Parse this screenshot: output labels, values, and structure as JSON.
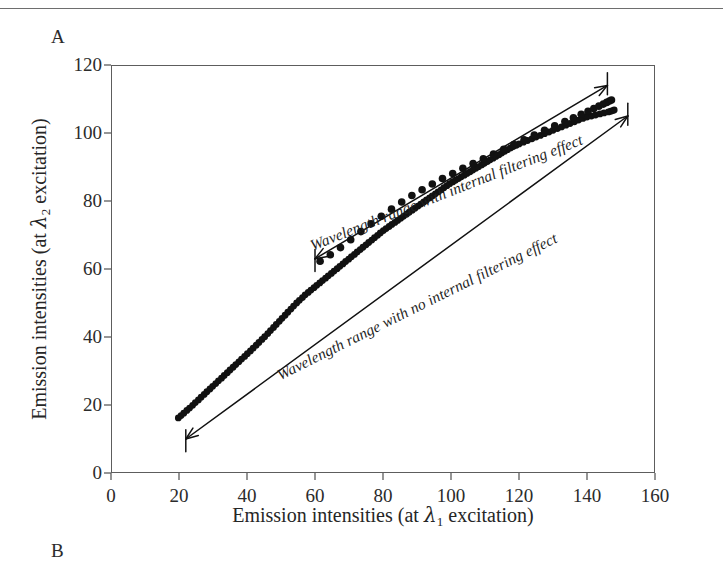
{
  "page": {
    "panel_a_label": "A",
    "panel_b_label": "B"
  },
  "figure": {
    "x_axis_title_prefix": "Emission intensities (at ",
    "x_axis_lambda": "λ",
    "x_axis_sub": "1",
    "x_axis_title_suffix": " excitation)",
    "y_axis_title_prefix": "Emission intensities (at ",
    "y_axis_lambda": "λ",
    "y_axis_sub": "2",
    "y_axis_title_suffix": " excitation)",
    "annotation_upper": "Wavelength range with internal filtering effect",
    "annotation_lower": "Wavelength range with no internal filtering effect"
  },
  "chart_data": {
    "type": "scatter",
    "title": "",
    "xlabel": "Emission intensities (at λ1 excitation)",
    "ylabel": "Emission intensities (at λ2 excitation)",
    "xlim": [
      0,
      160
    ],
    "ylim": [
      0,
      120
    ],
    "xticks": [
      0,
      20,
      40,
      60,
      80,
      100,
      120,
      140,
      160
    ],
    "yticks": [
      0,
      20,
      40,
      60,
      80,
      100,
      120
    ],
    "grid": false,
    "legend": "none",
    "frame": "full-box",
    "annotations": [
      {
        "name": "upper-range-annotation",
        "text": "Wavelength range with internal filtering effect",
        "style": "italic",
        "arrow": "double-headed-with-bars",
        "arrow_from_xy": [
          60,
          63
        ],
        "arrow_to_xy": [
          146,
          114
        ]
      },
      {
        "name": "lower-range-annotation",
        "text": "Wavelength range with no internal filtering effect",
        "style": "italic",
        "arrow": "double-headed-with-bars",
        "arrow_from_xy": [
          22,
          10
        ],
        "arrow_to_xy": [
          152,
          105
        ]
      }
    ],
    "series": [
      {
        "name": "no internal filtering effect",
        "marker": "dense-dots",
        "marker_size": 3.4,
        "points": [
          [
            19.8,
            16.2
          ],
          [
            20.6,
            16.9
          ],
          [
            21.4,
            17.6
          ],
          [
            22.3,
            18.4
          ],
          [
            23.1,
            19.1
          ],
          [
            24.0,
            19.9
          ],
          [
            24.8,
            20.7
          ],
          [
            25.7,
            21.5
          ],
          [
            26.5,
            22.3
          ],
          [
            27.4,
            23.1
          ],
          [
            28.2,
            23.9
          ],
          [
            29.1,
            24.7
          ],
          [
            29.9,
            25.5
          ],
          [
            30.8,
            26.3
          ],
          [
            31.6,
            27.1
          ],
          [
            32.5,
            27.9
          ],
          [
            33.3,
            28.7
          ],
          [
            34.2,
            29.5
          ],
          [
            35.0,
            30.3
          ],
          [
            35.9,
            31.1
          ],
          [
            36.7,
            31.9
          ],
          [
            37.6,
            32.7
          ],
          [
            38.4,
            33.5
          ],
          [
            39.3,
            34.3
          ],
          [
            40.1,
            35.1
          ],
          [
            41.0,
            35.9
          ],
          [
            41.8,
            36.7
          ],
          [
            42.7,
            37.6
          ],
          [
            43.5,
            38.4
          ],
          [
            44.4,
            39.3
          ],
          [
            45.2,
            40.1
          ],
          [
            46.1,
            41.0
          ],
          [
            46.9,
            41.9
          ],
          [
            47.8,
            42.8
          ],
          [
            48.6,
            43.7
          ],
          [
            49.5,
            44.6
          ],
          [
            50.3,
            45.5
          ],
          [
            51.2,
            46.4
          ],
          [
            52.0,
            47.3
          ],
          [
            52.9,
            48.2
          ],
          [
            53.7,
            49.1
          ],
          [
            54.6,
            50.0
          ],
          [
            55.4,
            50.8
          ],
          [
            56.3,
            51.6
          ],
          [
            57.1,
            52.4
          ],
          [
            58.0,
            53.1
          ],
          [
            58.8,
            53.8
          ],
          [
            59.7,
            54.5
          ],
          [
            60.5,
            55.2
          ],
          [
            61.4,
            55.9
          ],
          [
            62.2,
            56.6
          ],
          [
            63.1,
            57.3
          ],
          [
            63.9,
            58.0
          ],
          [
            64.8,
            58.7
          ],
          [
            65.6,
            59.4
          ],
          [
            66.5,
            60.1
          ],
          [
            67.3,
            60.8
          ],
          [
            68.2,
            61.5
          ],
          [
            69.0,
            62.2
          ],
          [
            69.9,
            62.9
          ],
          [
            70.7,
            63.6
          ],
          [
            71.6,
            64.3
          ],
          [
            72.4,
            65.0
          ],
          [
            73.3,
            65.7
          ],
          [
            74.1,
            66.4
          ],
          [
            75.0,
            67.1
          ],
          [
            75.8,
            67.8
          ],
          [
            76.7,
            68.5
          ],
          [
            77.5,
            69.2
          ],
          [
            78.4,
            69.9
          ],
          [
            79.2,
            70.6
          ],
          [
            80.1,
            71.3
          ],
          [
            80.9,
            71.9
          ],
          [
            81.8,
            72.5
          ],
          [
            82.6,
            73.1
          ],
          [
            83.5,
            73.7
          ],
          [
            84.3,
            74.3
          ],
          [
            85.2,
            74.9
          ],
          [
            86.0,
            75.5
          ],
          [
            86.9,
            76.1
          ],
          [
            87.7,
            76.7
          ],
          [
            88.6,
            77.3
          ],
          [
            89.4,
            77.9
          ],
          [
            90.3,
            78.5
          ],
          [
            91.1,
            79.1
          ],
          [
            92.0,
            79.7
          ],
          [
            92.8,
            80.3
          ],
          [
            93.7,
            80.9
          ],
          [
            94.5,
            81.5
          ],
          [
            95.4,
            82.1
          ],
          [
            96.2,
            82.7
          ],
          [
            97.1,
            83.3
          ],
          [
            97.9,
            83.9
          ],
          [
            98.8,
            84.5
          ],
          [
            99.6,
            85.1
          ],
          [
            100.5,
            85.6
          ],
          [
            101.3,
            86.1
          ],
          [
            102.2,
            86.6
          ],
          [
            103.0,
            87.1
          ],
          [
            103.9,
            87.6
          ],
          [
            104.7,
            88.1
          ],
          [
            105.6,
            88.6
          ],
          [
            106.4,
            89.1
          ],
          [
            107.3,
            89.6
          ],
          [
            108.1,
            90.1
          ],
          [
            109.0,
            90.6
          ],
          [
            109.8,
            91.1
          ],
          [
            110.7,
            91.6
          ],
          [
            111.5,
            92.1
          ],
          [
            112.4,
            92.6
          ],
          [
            113.2,
            93.1
          ],
          [
            114.1,
            93.6
          ],
          [
            114.9,
            94.1
          ],
          [
            115.8,
            94.6
          ],
          [
            116.6,
            95.1
          ],
          [
            117.5,
            95.6
          ],
          [
            118.3,
            96.0
          ],
          [
            119.2,
            96.4
          ],
          [
            120.0,
            96.8
          ],
          [
            121.3,
            97.3
          ],
          [
            122.5,
            97.8
          ],
          [
            123.8,
            98.3
          ],
          [
            125.0,
            98.8
          ],
          [
            126.3,
            99.3
          ],
          [
            127.5,
            99.8
          ],
          [
            128.8,
            100.3
          ],
          [
            130.0,
            100.8
          ],
          [
            131.3,
            101.3
          ],
          [
            132.5,
            101.8
          ],
          [
            133.8,
            102.3
          ],
          [
            135.0,
            102.8
          ],
          [
            136.3,
            103.3
          ],
          [
            137.5,
            103.8
          ],
          [
            138.8,
            104.3
          ],
          [
            140.0,
            104.7
          ],
          [
            141.3,
            105.0
          ],
          [
            142.5,
            105.3
          ],
          [
            143.8,
            105.6
          ],
          [
            145.0,
            105.9
          ],
          [
            146.3,
            106.2
          ],
          [
            147.0,
            106.4
          ],
          [
            147.6,
            106.6
          ],
          [
            148.0,
            106.8
          ]
        ]
      },
      {
        "name": "internal filtering effect",
        "marker": "sparse-dots",
        "marker_size": 3.8,
        "points": [
          [
            61.5,
            62.3
          ],
          [
            64.5,
            64.2
          ],
          [
            67.5,
            66.3
          ],
          [
            70.5,
            68.6
          ],
          [
            73.5,
            71.0
          ],
          [
            76.5,
            73.3
          ],
          [
            79.5,
            75.5
          ],
          [
            82.5,
            77.6
          ],
          [
            85.5,
            79.7
          ],
          [
            88.5,
            81.6
          ],
          [
            91.5,
            83.3
          ],
          [
            94.5,
            85.0
          ],
          [
            97.5,
            86.6
          ],
          [
            100.5,
            88.1
          ],
          [
            103.5,
            89.6
          ],
          [
            106.5,
            91.0
          ],
          [
            109.5,
            92.4
          ],
          [
            112.5,
            93.8
          ],
          [
            115.5,
            95.2
          ],
          [
            118.5,
            96.6
          ],
          [
            121.5,
            98.0
          ],
          [
            124.5,
            99.4
          ],
          [
            127.5,
            100.8
          ],
          [
            130.5,
            102.1
          ],
          [
            133.5,
            103.4
          ],
          [
            136.0,
            104.5
          ],
          [
            138.3,
            105.5
          ],
          [
            140.3,
            106.4
          ],
          [
            142.0,
            107.2
          ],
          [
            143.5,
            107.9
          ],
          [
            144.8,
            108.5
          ],
          [
            145.8,
            109.0
          ],
          [
            146.6,
            109.4
          ],
          [
            147.2,
            109.7
          ]
        ]
      }
    ]
  }
}
